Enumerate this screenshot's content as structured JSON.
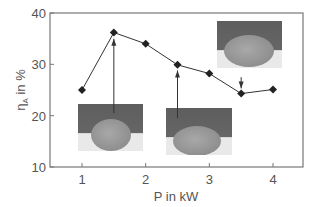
{
  "chart_data": {
    "type": "line",
    "title": "",
    "xlabel": "P in kW",
    "ylabel": "η_A in %",
    "ylabel_main": "η",
    "ylabel_sub": "A",
    "ylabel_rest": " in %",
    "xlim": [
      0.5,
      4.5
    ],
    "ylim": [
      10,
      40
    ],
    "x_ticks": [
      1,
      2,
      3,
      4
    ],
    "y_ticks": [
      10,
      20,
      30,
      40
    ],
    "grid": false,
    "legend": null,
    "series": [
      {
        "name": "eta_A",
        "marker": "diamond",
        "color": "#222222",
        "x": [
          1,
          1.5,
          2,
          2.5,
          3,
          3.5,
          4
        ],
        "y": [
          25.0,
          36.2,
          34.0,
          29.9,
          28.2,
          24.3,
          25.1
        ]
      }
    ],
    "annotations": [
      {
        "type": "arrow",
        "direction": "up",
        "x": 1.5,
        "from_y": 20.5,
        "to_y": 35.0,
        "inset": "left"
      },
      {
        "type": "arrow",
        "direction": "up",
        "x": 2.5,
        "from_y": 19.5,
        "to_y": 28.8,
        "inset": "middle"
      },
      {
        "type": "arrow",
        "direction": "down",
        "x": 3.5,
        "from_y": 27.5,
        "to_y": 25.3,
        "inset": "right"
      }
    ],
    "insets": [
      {
        "name": "left",
        "desc": "cross-section micrograph",
        "left": 78,
        "top": 104,
        "width": 65,
        "height": 47,
        "bead_w": 40,
        "bead_h": 32,
        "bead_cx": 33,
        "bead_cy": 31
      },
      {
        "name": "middle",
        "desc": "cross-section micrograph",
        "left": 166,
        "top": 108,
        "width": 66,
        "height": 47,
        "bead_w": 48,
        "bead_h": 30,
        "bead_cx": 31,
        "bead_cy": 33
      },
      {
        "name": "right",
        "desc": "cross-section micrograph",
        "left": 217,
        "top": 21,
        "width": 65,
        "height": 47,
        "bead_w": 50,
        "bead_h": 32,
        "bead_cx": 32,
        "bead_cy": 30
      }
    ]
  },
  "plot_area": {
    "left": 50,
    "top": 13,
    "right": 303,
    "bottom": 167
  }
}
